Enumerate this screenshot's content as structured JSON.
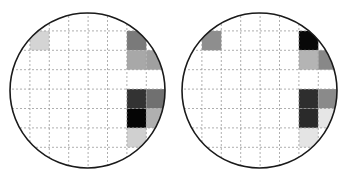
{
  "figure": {
    "grid": {
      "cols": 8,
      "rows": 8
    },
    "panels": [
      {
        "id": "left",
        "cells": [
          {
            "col": 1,
            "row": 1,
            "color": "#d4d4d4"
          },
          {
            "col": 6,
            "row": 1,
            "color": "#7a7a7a"
          },
          {
            "col": 6,
            "row": 2,
            "color": "#a8a8a8"
          },
          {
            "col": 7,
            "row": 2,
            "color": "#a0a0a0"
          },
          {
            "col": 6,
            "row": 4,
            "color": "#333333"
          },
          {
            "col": 7,
            "row": 4,
            "color": "#707070"
          },
          {
            "col": 6,
            "row": 5,
            "color": "#050505"
          },
          {
            "col": 7,
            "row": 5,
            "color": "#b0b0b0"
          },
          {
            "col": 6,
            "row": 6,
            "color": "#d0d0d0"
          }
        ]
      },
      {
        "id": "right",
        "cells": [
          {
            "col": 1,
            "row": 1,
            "color": "#8e8e8e"
          },
          {
            "col": 6,
            "row": 1,
            "color": "#080808"
          },
          {
            "col": 6,
            "row": 2,
            "color": "#b4b4b4"
          },
          {
            "col": 7,
            "row": 2,
            "color": "#888888"
          },
          {
            "col": 6,
            "row": 4,
            "color": "#2e2e2e"
          },
          {
            "col": 7,
            "row": 4,
            "color": "#8a8a8a"
          },
          {
            "col": 6,
            "row": 5,
            "color": "#2a2a2a"
          },
          {
            "col": 7,
            "row": 5,
            "color": "#e6e6e6"
          },
          {
            "col": 6,
            "row": 6,
            "color": "#e4e4e4"
          }
        ]
      }
    ],
    "colors": {
      "outline": "#1a1a1a",
      "grid_line": "#9a9a9a",
      "background": "#ffffff"
    }
  }
}
